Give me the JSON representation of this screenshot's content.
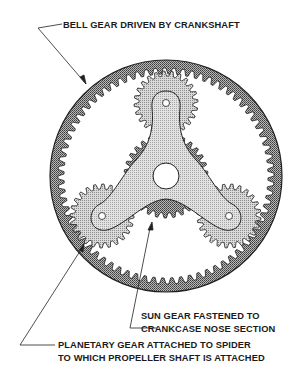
{
  "diagram": {
    "colors": {
      "ring_fill": "#8a8a8a",
      "sun_fill": "#8f8f8f",
      "planet_fill": "#bdbdbd",
      "spider_fill": "#d0d0d0",
      "outline": "#222222",
      "background": "#ffffff"
    },
    "labels": {
      "bell_gear": "BELL GEAR DRIVEN BY CRANKSHAFT",
      "sun_gear_line1": "SUN GEAR FASTENED TO",
      "sun_gear_line2": "CRANKCASE NOSE SECTION",
      "planetary_line1": "PLANETARY GEAR ATTACHED TO SPIDER",
      "planetary_line2": "TO WHICH PROPELLER SHAFT IS ATTACHED"
    },
    "components": [
      {
        "name": "bell-gear",
        "type": "internal ring gear",
        "center": [
          166,
          176
        ],
        "outer_radius": 116
      },
      {
        "name": "sun-gear",
        "type": "external gear",
        "center": [
          166,
          176
        ]
      },
      {
        "name": "planet-gear-top",
        "center": [
          166,
          103
        ]
      },
      {
        "name": "planet-gear-left",
        "center": [
          102,
          216
        ]
      },
      {
        "name": "planet-gear-right",
        "center": [
          229,
          216
        ]
      },
      {
        "name": "spider",
        "type": "three-armed carrier",
        "center": [
          166,
          176
        ]
      }
    ]
  }
}
